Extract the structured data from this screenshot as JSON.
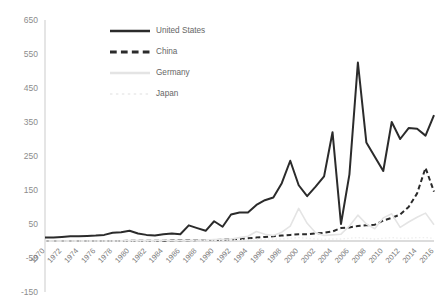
{
  "chart_data": {
    "type": "line",
    "title": "",
    "subtitle": "",
    "xlabel": "",
    "ylabel": "",
    "grid": false,
    "legend_position": "top-center",
    "xlim": [
      1970,
      2016
    ],
    "ylim": [
      -150,
      650
    ],
    "ytick_labels": [
      "650",
      "550",
      "450",
      "350",
      "250",
      "150",
      "50",
      "-50",
      "-150"
    ],
    "ytick_values": [
      650,
      550,
      450,
      350,
      250,
      150,
      50,
      -50,
      -150
    ],
    "xtick_labels": [
      "1970",
      "1972",
      "1974",
      "1976",
      "1978",
      "1980",
      "1982",
      "1984",
      "1986",
      "1988",
      "1990",
      "1992",
      "1994",
      "1996",
      "1998",
      "2000",
      "2002",
      "2004",
      "2006",
      "2008",
      "2010",
      "2012",
      "2014",
      "2016"
    ],
    "xtick_values": [
      1970,
      1972,
      1974,
      1976,
      1978,
      1980,
      1982,
      1984,
      1986,
      1988,
      1990,
      1992,
      1994,
      1996,
      1998,
      2000,
      2002,
      2004,
      2006,
      2008,
      2010,
      2012,
      2014,
      2016
    ],
    "x": [
      1970,
      1971,
      1972,
      1973,
      1974,
      1975,
      1976,
      1977,
      1978,
      1979,
      1980,
      1981,
      1982,
      1983,
      1984,
      1985,
      1986,
      1987,
      1988,
      1989,
      1990,
      1991,
      1992,
      1993,
      1994,
      1995,
      1996,
      1997,
      1998,
      1999,
      2000,
      2001,
      2002,
      2003,
      2004,
      2005,
      2006,
      2007,
      2008,
      2009,
      2010,
      2011,
      2012,
      2013,
      2014,
      2015,
      2016
    ],
    "series": [
      {
        "name": "United States",
        "color": "#2b2b2b",
        "style": "solid",
        "width": 2.0,
        "values": [
          10,
          10,
          12,
          14,
          14,
          15,
          16,
          18,
          24,
          26,
          30,
          22,
          18,
          16,
          20,
          22,
          20,
          46,
          38,
          30,
          58,
          42,
          78,
          84,
          84,
          106,
          120,
          128,
          170,
          236,
          164,
          132,
          160,
          190,
          320,
          50,
          196,
          525,
          290,
          248,
          206,
          350,
          300,
          332,
          330,
          310,
          370
        ]
      },
      {
        "name": "China",
        "color": "#2b2b2b",
        "style": "dashed",
        "width": 2.0,
        "values": [
          0,
          0,
          0,
          0,
          0,
          0,
          0,
          0,
          0,
          0,
          1,
          1,
          1,
          1,
          1,
          2,
          2,
          2,
          3,
          3,
          3,
          4,
          5,
          6,
          8,
          10,
          12,
          14,
          16,
          18,
          20,
          20,
          22,
          24,
          28,
          38,
          40,
          44,
          46,
          48,
          60,
          68,
          78,
          100,
          140,
          215,
          145
        ]
      },
      {
        "name": "Germany",
        "color": "#e4e4e4",
        "style": "solid",
        "width": 1.6,
        "values": [
          0,
          0,
          0,
          0,
          0,
          0,
          0,
          0,
          0,
          0,
          1,
          1,
          1,
          1,
          2,
          2,
          2,
          2,
          3,
          3,
          4,
          5,
          6,
          10,
          14,
          28,
          20,
          16,
          26,
          44,
          96,
          52,
          24,
          16,
          18,
          20,
          44,
          76,
          50,
          36,
          68,
          80,
          40,
          56,
          70,
          82,
          48
        ]
      },
      {
        "name": "Japan",
        "color": "#efefef",
        "style": "dotted",
        "width": 1.4,
        "values": [
          0,
          0,
          0,
          0,
          0,
          0,
          0,
          0,
          0,
          0,
          0,
          0,
          0,
          0,
          1,
          1,
          1,
          1,
          1,
          2,
          2,
          2,
          3,
          3,
          4,
          5,
          5,
          6,
          6,
          8,
          10,
          8,
          6,
          5,
          6,
          6,
          8,
          10,
          8,
          6,
          8,
          10,
          8,
          8,
          10,
          10,
          8
        ]
      }
    ]
  },
  "legend": {
    "items": [
      {
        "label": "United States"
      },
      {
        "label": "China"
      },
      {
        "label": "Germany"
      },
      {
        "label": "Japan"
      }
    ]
  }
}
